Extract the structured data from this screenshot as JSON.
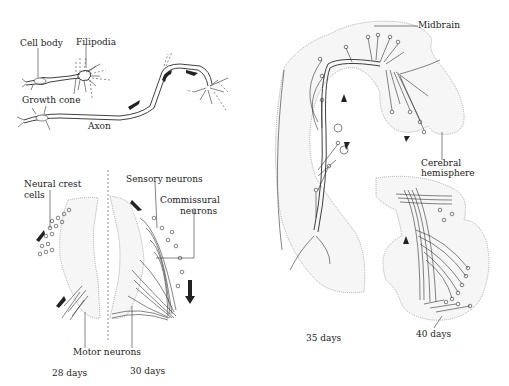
{
  "figure": {
    "panels": [
      {
        "id": "axon-growth",
        "labels": {
          "cell_body": "Cell body",
          "filipodia": "Filipodia",
          "growth_cone": "Growth cone",
          "axon": "Axon"
        }
      },
      {
        "id": "spinal-cord",
        "labels": {
          "neural_crest": "Neural crest",
          "neural_crest_2": "cells",
          "sensory": "Sensory neurons",
          "commissural": "Commissural",
          "commissural_2": "neurons",
          "motor": "Motor neurons"
        },
        "stages": [
          "28 days",
          "30 days"
        ]
      },
      {
        "id": "brain-35",
        "labels": {
          "midbrain": "Midbrain",
          "cerebral": "Cerebral",
          "cerebral_2": "hemisphere"
        },
        "stage": "35 days"
      },
      {
        "id": "brain-40",
        "stage": "40 days"
      }
    ]
  }
}
